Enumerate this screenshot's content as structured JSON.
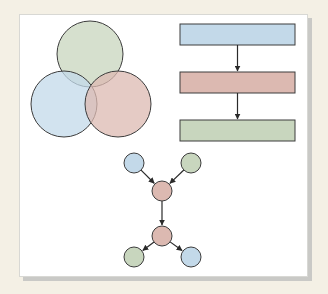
{
  "diagram": {
    "title": "",
    "colors": {
      "blue": "#c3d9e9",
      "red": "#dcb9b1",
      "green": "#c8d6be",
      "stroke": "#3c3c3c",
      "background": "#f4f0e5",
      "card": "#ffffff",
      "shadow": "#c9c9c6"
    },
    "venn": {
      "circles": [
        {
          "name": "top",
          "color": "green",
          "cx": 90,
          "cy": 54,
          "r": 33
        },
        {
          "name": "left",
          "color": "blue",
          "cx": 64,
          "cy": 104,
          "r": 33
        },
        {
          "name": "right",
          "color": "red",
          "cx": 118,
          "cy": 104,
          "r": 33
        }
      ]
    },
    "flowchart": {
      "boxes": [
        {
          "name": "step-1",
          "color": "blue",
          "x": 180,
          "y": 24,
          "w": 115,
          "h": 21
        },
        {
          "name": "step-2",
          "color": "red",
          "x": 180,
          "y": 72,
          "w": 115,
          "h": 21
        },
        {
          "name": "step-3",
          "color": "green",
          "x": 180,
          "y": 120,
          "w": 115,
          "h": 21
        }
      ],
      "arrows": [
        {
          "from": "step-1",
          "to": "step-2"
        },
        {
          "from": "step-2",
          "to": "step-3"
        }
      ]
    },
    "graph": {
      "nodes": [
        {
          "id": "n1",
          "color": "blue",
          "cx": 134,
          "cy": 163,
          "r": 10
        },
        {
          "id": "n2",
          "color": "green",
          "cx": 191,
          "cy": 163,
          "r": 10
        },
        {
          "id": "n3",
          "color": "red",
          "cx": 162,
          "cy": 191,
          "r": 10
        },
        {
          "id": "n4",
          "color": "red",
          "cx": 162,
          "cy": 236,
          "r": 10
        },
        {
          "id": "n5",
          "color": "green",
          "cx": 134,
          "cy": 257,
          "r": 10
        },
        {
          "id": "n6",
          "color": "blue",
          "cx": 191,
          "cy": 257,
          "r": 10
        }
      ],
      "edges": [
        {
          "from": "n1",
          "to": "n3"
        },
        {
          "from": "n2",
          "to": "n3"
        },
        {
          "from": "n3",
          "to": "n4"
        },
        {
          "from": "n4",
          "to": "n5"
        },
        {
          "from": "n4",
          "to": "n6"
        }
      ]
    }
  }
}
